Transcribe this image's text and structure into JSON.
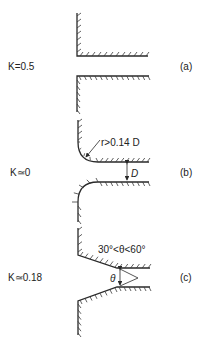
{
  "figure": {
    "panels": [
      {
        "id": "a",
        "panel_label": "(a)",
        "loss_coefficient_label": "K=0.5",
        "description": "sharp-edged entrance"
      },
      {
        "id": "b",
        "panel_label": "(b)",
        "loss_coefficient_label": "K≃0",
        "description": "well-rounded entrance",
        "annotations": {
          "radius": "r>0.14 D",
          "diameter": "D"
        }
      },
      {
        "id": "c",
        "panel_label": "(c)",
        "loss_coefficient_label": "K≃0.18",
        "description": "chamfered (conical) entrance",
        "annotations": {
          "angle_range": "30°<θ<60°",
          "angle": "θ"
        }
      }
    ]
  }
}
